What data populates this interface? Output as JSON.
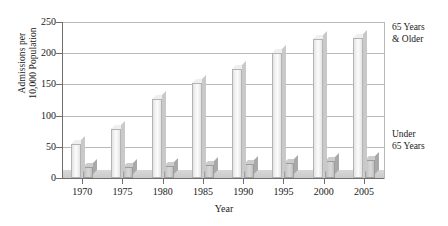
{
  "chart_data": {
    "type": "bar",
    "title": "",
    "subtitle": "",
    "xlabel": "Year",
    "ylabel": "Admissions per 10,000 Population",
    "ylabel_lines": [
      "Admissions per",
      "10,000 Population"
    ],
    "categories": [
      "1970",
      "1975",
      "1980",
      "1985",
      "1990",
      "1995",
      "2000",
      "2005"
    ],
    "series": [
      {
        "name": "65 Years & Older",
        "values": [
          55,
          78,
          127,
          153,
          175,
          200,
          222,
          225
        ]
      },
      {
        "name": "Under 65 Years",
        "values": [
          17,
          17,
          19,
          21,
          22,
          24,
          27,
          29
        ]
      }
    ],
    "yticks": [
      0,
      50,
      100,
      150,
      200,
      250
    ],
    "ylim": [
      0,
      250
    ],
    "grid": true,
    "legend_position": "right-annotations",
    "annotations": [
      {
        "id": "older",
        "lines": [
          "65 Years",
          "& Older"
        ]
      },
      {
        "id": "under",
        "lines": [
          "Under",
          "65 Years"
        ]
      }
    ],
    "colors": {
      "bar_older": "#f2f2f2",
      "bar_under": "#cfcfcf",
      "grid": "#b9b9b9",
      "axis": "#6e6e6e",
      "text": "#1a1a1a",
      "background": "#ffffff"
    }
  }
}
